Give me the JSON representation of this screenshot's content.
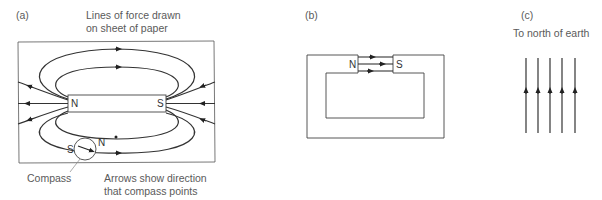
{
  "panel_a": {
    "label": "(a)",
    "caption_line1": "Lines of force drawn",
    "caption_line2": "on sheet of paper",
    "magnet_north": "N",
    "magnet_south": "S",
    "compass_south": "S",
    "compass_north": "N",
    "compass_label": "Compass",
    "arrows_note_line1": "Arrows show direction",
    "arrows_note_line2": "that compass points"
  },
  "panel_b": {
    "label": "(b)",
    "magnet_north": "N",
    "magnet_south": "S"
  },
  "panel_c": {
    "label": "(c)",
    "caption": "To north of earth",
    "line_count": 5
  },
  "colors": {
    "line": "#333333",
    "text": "#5a5a5a"
  }
}
